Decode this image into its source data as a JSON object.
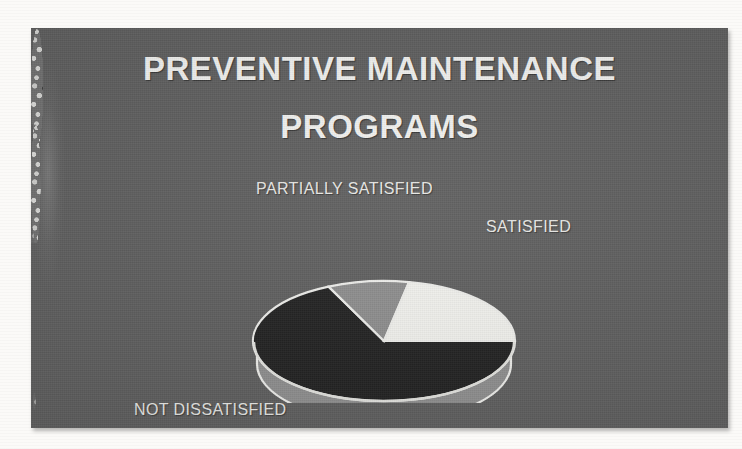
{
  "slide": {
    "title_line_1": "PREVENTIVE MAINTENANCE",
    "title_line_2": "PROGRAMS",
    "background_color": "#5d5d5d",
    "title_color": "#f3f3f1",
    "label_color": "#e9e9e6",
    "decoration": "speckled-granite-edge-band"
  },
  "chart_data": {
    "type": "pie",
    "title": "PREVENTIVE MAINTENANCE PROGRAMS",
    "subtitle": "",
    "xlabel": "",
    "ylabel": "",
    "style": "3d-pie",
    "legend_position": "outside-labels",
    "grid": false,
    "labels": [
      "SATISFIED",
      "PARTIALLY SATISFIED",
      "NOT DISSATISFIED"
    ],
    "values": [
      22,
      10,
      68
    ],
    "units": "percent",
    "colors": [
      "#f2f2ee",
      "#8c8c8c",
      "#1e1e1e"
    ],
    "slices": [
      {
        "label": "SATISFIED",
        "value": 22,
        "color": "#f2f2ee",
        "start_angle_deg": 0,
        "end_angle_deg": 79,
        "label_position": "upper-right"
      },
      {
        "label": "PARTIALLY SATISFIED",
        "value": 10,
        "color": "#8c8c8c",
        "start_angle_deg": 79,
        "end_angle_deg": 115,
        "label_position": "top-left"
      },
      {
        "label": "NOT DISSATISFIED",
        "value": 68,
        "color": "#1e1e1e",
        "start_angle_deg": 115,
        "end_angle_deg": 360,
        "label_position": "bottom-left"
      }
    ]
  },
  "labels": {
    "satisfied": "SATISFIED",
    "partially_satisfied": "PARTIALLY SATISFIED",
    "not_dissatisfied": "NOT DISSATISFIED"
  }
}
